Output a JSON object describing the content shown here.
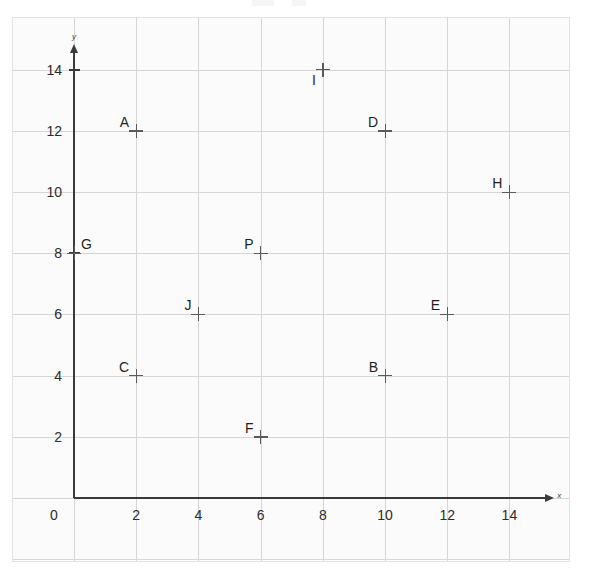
{
  "figure": {
    "kind": "coordinate-grid-scatter",
    "background_color": "#fbfbfb",
    "grid_color": "#d6d6d6",
    "axis_color": "#3a3a3a",
    "marker_color": "#5a5a5a",
    "label_color": "#1f1f1f",
    "x_axis_name": "x",
    "y_axis_name": "y"
  },
  "axis": {
    "x_ticks": [
      "0",
      "2",
      "4",
      "6",
      "8",
      "10",
      "12",
      "14"
    ],
    "y_ticks": [
      "2",
      "4",
      "6",
      "8",
      "10",
      "12",
      "14"
    ],
    "origin_label": "0"
  },
  "chart_data": {
    "type": "scatter",
    "title": "",
    "subtitle": "",
    "xlabel": "x",
    "ylabel": "y",
    "xlim": [
      -1,
      16
    ],
    "ylim": [
      -1.5,
      16
    ],
    "xticks": [
      0,
      2,
      4,
      6,
      8,
      10,
      12,
      14
    ],
    "yticks": [
      0,
      2,
      4,
      6,
      8,
      10,
      12,
      14
    ],
    "grid": true,
    "grid_step": 2,
    "legend": "none",
    "marker_style": "plus",
    "point_labels_visible": true,
    "points": [
      {
        "name": "A",
        "x": 2,
        "y": 12,
        "label_pos": "upper-left"
      },
      {
        "name": "B",
        "x": 10,
        "y": 4,
        "label_pos": "upper-left"
      },
      {
        "name": "C",
        "x": 2,
        "y": 4,
        "label_pos": "upper-left"
      },
      {
        "name": "D",
        "x": 10,
        "y": 12,
        "label_pos": "upper-left"
      },
      {
        "name": "E",
        "x": 12,
        "y": 6,
        "label_pos": "upper-left"
      },
      {
        "name": "F",
        "x": 6,
        "y": 2,
        "label_pos": "upper-left"
      },
      {
        "name": "G",
        "x": 0,
        "y": 8,
        "label_pos": "upper-right"
      },
      {
        "name": "H",
        "x": 14,
        "y": 10,
        "label_pos": "upper-left"
      },
      {
        "name": "I",
        "x": 8,
        "y": 14,
        "label_pos": "lower-left"
      },
      {
        "name": "J",
        "x": 4,
        "y": 6,
        "label_pos": "upper-left"
      },
      {
        "name": "P",
        "x": 6,
        "y": 8,
        "label_pos": "upper-left"
      }
    ]
  }
}
